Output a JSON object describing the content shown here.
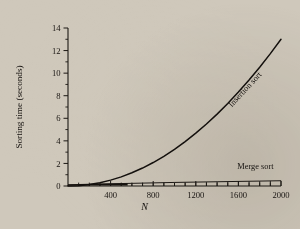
{
  "figure": {
    "background_color": "#cfc8bb",
    "ink_color": "#14100d"
  },
  "chart_data": {
    "type": "line",
    "title": "",
    "xlabel": "N",
    "ylabel": "Sorting time (seconds)",
    "xlim": [
      0,
      2000
    ],
    "ylim": [
      0,
      14
    ],
    "grid": false,
    "legend_position": "inline-annotations",
    "x_ticks": [
      400,
      800,
      1200,
      1600,
      2000
    ],
    "x_tick_labels": [
      "400",
      "800",
      "1200",
      "1600",
      "2000"
    ],
    "x_minor_tick_step": 100,
    "y_ticks": [
      0,
      2,
      4,
      6,
      8,
      10,
      12,
      14
    ],
    "y_tick_labels": [
      "0",
      "2",
      "4",
      "6",
      "8",
      "10",
      "12",
      "14"
    ],
    "y_minor_tick_step": 1,
    "annotations": [
      {
        "text": "Insertion sort",
        "x": 1680,
        "y": 8.4,
        "rotation": -47
      },
      {
        "text": "Merge sort",
        "x": 1760,
        "y": 1.55,
        "rotation": 0
      }
    ],
    "series": [
      {
        "name": "Insertion sort",
        "type": "line",
        "x": [
          0,
          100,
          200,
          300,
          400,
          500,
          600,
          700,
          800,
          900,
          1000,
          1100,
          1200,
          1300,
          1400,
          1500,
          1600,
          1700,
          1800,
          1900,
          2000
        ],
        "values": [
          0.0,
          0.03,
          0.13,
          0.29,
          0.52,
          0.81,
          1.17,
          1.59,
          2.08,
          2.63,
          3.25,
          3.93,
          4.68,
          5.49,
          6.37,
          7.31,
          8.32,
          9.39,
          10.53,
          11.73,
          13.0
        ]
      },
      {
        "name": "Merge sort",
        "type": "line",
        "x": [
          0,
          200,
          400,
          600,
          800,
          1000,
          1200,
          1400,
          1600,
          1800,
          2000
        ],
        "values": [
          0.0,
          0.05,
          0.09,
          0.13,
          0.17,
          0.21,
          0.24,
          0.27,
          0.3,
          0.33,
          0.36
        ]
      }
    ]
  }
}
